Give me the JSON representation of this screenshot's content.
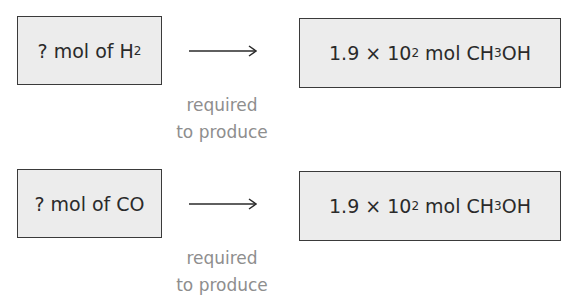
{
  "rows": [
    {
      "left": {
        "prefix": "? mol of H",
        "subscript": "2"
      },
      "right": {
        "coef": "1.9 × 10",
        "exp": "2",
        "unit": " mol CH",
        "sub": "3",
        "tail": "OH"
      },
      "label_line1": "required",
      "label_line2": "to produce"
    },
    {
      "left": {
        "prefix": "? mol of CO",
        "subscript": ""
      },
      "right": {
        "coef": "1.9 × 10",
        "exp": "2",
        "unit": " mol CH",
        "sub": "3",
        "tail": "OH"
      },
      "label_line1": "required",
      "label_line2": "to produce"
    }
  ]
}
